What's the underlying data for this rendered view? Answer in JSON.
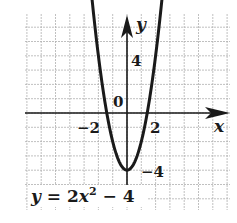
{
  "chart_data": {
    "type": "line",
    "title": "",
    "equation": "y = 2x² − 4",
    "equation_parts": {
      "lhs": "y",
      "eq": " = 2",
      "var": "x",
      "exp": "2",
      "rest": " − 4"
    },
    "function": {
      "a": 2,
      "b": 0,
      "c": -4
    },
    "xlabel": "x",
    "ylabel": "y",
    "xlim": [
      -7,
      7
    ],
    "ylim": [
      -7,
      7
    ],
    "grid": true,
    "grid_step": 1,
    "tick_labels": {
      "x": [
        {
          "value": -2,
          "text": "−2"
        },
        {
          "value": 2,
          "text": "2"
        }
      ],
      "y": [
        {
          "value": 4,
          "text": "4"
        },
        {
          "value": -4,
          "text": "−4"
        }
      ],
      "origin": "0"
    },
    "series": [
      {
        "name": "y = 2x^2 - 4",
        "x": [
          -2.6,
          -2,
          -1.5,
          -1,
          -0.5,
          0,
          0.5,
          1,
          1.5,
          2,
          2.6
        ],
        "y": [
          9.52,
          4,
          0.5,
          -2,
          -3.5,
          -4,
          -3.5,
          -2,
          0.5,
          4,
          9.52
        ]
      }
    ],
    "key_points": {
      "vertex": [
        0,
        -4
      ],
      "x_intercepts": [
        -1.414,
        1.414
      ]
    },
    "colors": {
      "curve": "#1a1a1a",
      "grid": "#b0b0b0",
      "axis": "#1a1a1a"
    }
  }
}
